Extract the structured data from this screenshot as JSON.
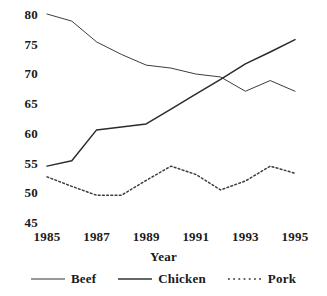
{
  "chart_data": {
    "type": "line",
    "title": "",
    "xlabel": "Year",
    "ylabel": "",
    "x": [
      1985,
      1986,
      1987,
      1988,
      1989,
      1990,
      1991,
      1992,
      1993,
      1994,
      1995
    ],
    "xlim": [
      1985,
      1995
    ],
    "ylim": [
      45,
      80
    ],
    "xticks": [
      "1985",
      "1987",
      "1989",
      "1991",
      "1993",
      "1995"
    ],
    "xtick_values": [
      1985,
      1987,
      1989,
      1991,
      1993,
      1995
    ],
    "yticks": [
      "45",
      "50",
      "55",
      "60",
      "65",
      "70",
      "75",
      "80"
    ],
    "ytick_values": [
      45,
      50,
      55,
      60,
      65,
      70,
      75,
      80
    ],
    "grid": false,
    "legend_position": "bottom",
    "series": [
      {
        "name": "Beef",
        "style": "solid",
        "color": "#3d3d3d",
        "width": 1.0,
        "values": [
          80.0,
          78.8,
          75.3,
          73.2,
          71.4,
          70.9,
          69.9,
          69.4,
          67.0,
          68.8,
          67.0
        ]
      },
      {
        "name": "Chicken",
        "style": "solid",
        "color": "#2b2b2b",
        "width": 1.5,
        "values": [
          54.4,
          55.3,
          60.5,
          61.0,
          61.5,
          64.0,
          66.5,
          69.0,
          71.6,
          73.6,
          75.7
        ]
      },
      {
        "name": "Pork",
        "style": "dotted",
        "color": "#3d3d3d",
        "width": 1.5,
        "values": [
          52.6,
          51.0,
          49.5,
          49.5,
          52.0,
          54.4,
          53.0,
          50.4,
          51.9,
          54.4,
          53.2
        ]
      }
    ]
  },
  "axes": {
    "x_title": "Year"
  },
  "legend": {
    "items": [
      {
        "label": "Beef",
        "style": "solid",
        "width": 1.0
      },
      {
        "label": "Chicken",
        "style": "solid",
        "width": 1.6
      },
      {
        "label": "Pork",
        "style": "dotted",
        "width": 1.6
      }
    ]
  },
  "colors": {
    "line": "#333333",
    "text": "#1a1a1a",
    "background": "#ffffff"
  }
}
